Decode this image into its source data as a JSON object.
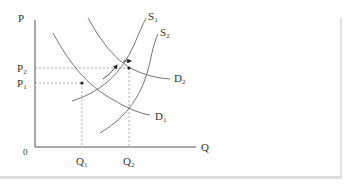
{
  "diagram": {
    "type": "supply-demand-shift",
    "axes": {
      "y_label": "P",
      "x_label": "Q",
      "origin_label": "0"
    },
    "price_levels": [
      {
        "id": "P1",
        "base": "P",
        "sub": "1"
      },
      {
        "id": "P2",
        "base": "P",
        "sub": "2"
      }
    ],
    "quantity_levels": [
      {
        "id": "Q1",
        "base": "Q",
        "sub": "1"
      },
      {
        "id": "Q2",
        "base": "Q",
        "sub": "2"
      }
    ],
    "curves": [
      {
        "id": "S1",
        "base": "S",
        "sub": "1",
        "kind": "supply"
      },
      {
        "id": "S2",
        "base": "S",
        "sub": "2",
        "kind": "supply"
      },
      {
        "id": "D1",
        "base": "D",
        "sub": "1",
        "kind": "demand"
      },
      {
        "id": "D2",
        "base": "D",
        "sub": "2",
        "kind": "demand"
      }
    ],
    "equilibria": [
      {
        "label": "E1",
        "price": "P1",
        "quantity": "Q1",
        "curves": [
          "S1",
          "D1"
        ]
      },
      {
        "label": "E2",
        "price": "P2",
        "quantity": "Q2",
        "curves": [
          "S2",
          "D2"
        ]
      }
    ],
    "arrows": [
      {
        "meaning": "movement along path toward new equilibrium",
        "direction": "up-right"
      },
      {
        "meaning": "supply shift",
        "direction": "right"
      }
    ],
    "colors": {
      "lines": "#555555",
      "guides": "#999999",
      "frame": "#dcdcdc"
    }
  }
}
